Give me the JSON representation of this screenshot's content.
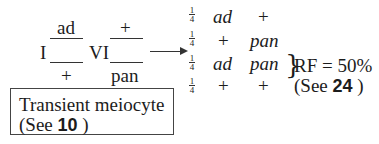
{
  "cross": {
    "chrom1_label": "I",
    "chrom1_top": "ad",
    "chrom1_bottom": "+",
    "chrom2_label": "VI",
    "chrom2_top": "+",
    "chrom2_bottom": "pan"
  },
  "box": {
    "line1": "Transient meiocyte",
    "line2_prefix": "(See",
    "line2_ref": "10",
    "line2_suffix": ")"
  },
  "progeny": [
    {
      "num": "1",
      "den": "4",
      "a": "ad",
      "b": "+"
    },
    {
      "num": "1",
      "den": "4",
      "a": "+",
      "b": "pan"
    },
    {
      "num": "1",
      "den": "4",
      "a": "ad",
      "b": "pan"
    },
    {
      "num": "1",
      "den": "4",
      "a": "+",
      "b": "+"
    }
  ],
  "rf": {
    "line1": "RF = 50%",
    "line2_prefix": "(See",
    "line2_ref": "24",
    "line2_suffix": ")"
  }
}
